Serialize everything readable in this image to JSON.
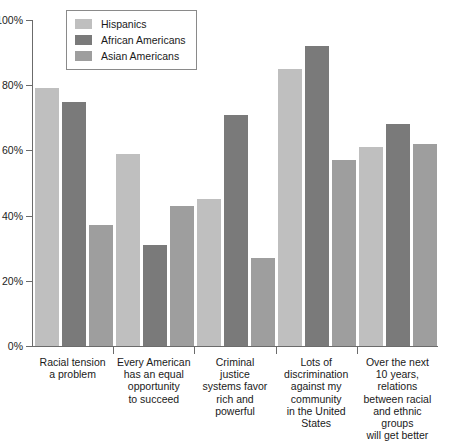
{
  "chart_data": {
    "type": "bar",
    "title": "",
    "xlabel": "",
    "ylabel": "",
    "ylim": [
      0,
      100
    ],
    "ytick_labels": [
      "0%",
      "20%",
      "40%",
      "60%",
      "80%",
      "100%"
    ],
    "ytick_values": [
      0,
      20,
      40,
      60,
      80,
      100
    ],
    "grid": false,
    "legend_position": "top-left",
    "categories": [
      "Racial tension a problem",
      "Every American has an equal opportunity to succeed",
      "Criminal justice systems favor rich and powerful",
      "Lots of discrimination against my community in the United States",
      "Over the next 10 years, relations between racial and ethnic groups will get better"
    ],
    "category_lines": [
      [
        "Racial tension",
        "a problem"
      ],
      [
        "Every American",
        "has an equal",
        "opportunity",
        "to succeed"
      ],
      [
        "Criminal",
        "justice",
        "systems favor",
        "rich and",
        "powerful"
      ],
      [
        "Lots of",
        "discrimination",
        "against my",
        "community",
        "in the United",
        "States"
      ],
      [
        "Over the next",
        "10 years,",
        "relations",
        "between racial",
        "and ethnic",
        "groups",
        "will get better"
      ]
    ],
    "series": [
      {
        "name": "Hispanics",
        "color": "#bfbfbf",
        "values": [
          79,
          59,
          45,
          85,
          61
        ]
      },
      {
        "name": "African Americans",
        "color": "#7a7a7a",
        "values": [
          75,
          31,
          71,
          92,
          68
        ]
      },
      {
        "name": "Asian Americans",
        "color": "#9e9e9e",
        "values": [
          37,
          43,
          27,
          57,
          62
        ]
      }
    ]
  },
  "legend": {
    "items": [
      {
        "label": "Hispanics",
        "color": "#bfbfbf"
      },
      {
        "label": "African Americans",
        "color": "#7a7a7a"
      },
      {
        "label": "Asian Americans",
        "color": "#9e9e9e"
      }
    ]
  }
}
